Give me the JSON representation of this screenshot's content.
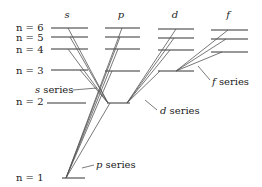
{
  "diagram": {
    "columns": [
      {
        "label": "s"
      },
      {
        "label": "p"
      },
      {
        "label": "d"
      },
      {
        "label": "f"
      }
    ],
    "levels": [
      {
        "label": "n = 6"
      },
      {
        "label": "n = 5"
      },
      {
        "label": "n = 4"
      },
      {
        "label": "n = 3"
      },
      {
        "label": "n = 2"
      },
      {
        "label": "n = 1"
      }
    ],
    "series_labels": [
      {
        "label": "s series"
      },
      {
        "label": "p series"
      },
      {
        "label": "d series"
      },
      {
        "label": "f series"
      }
    ]
  }
}
